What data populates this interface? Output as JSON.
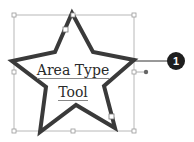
{
  "figure": {
    "text_lines": [
      "Area Type",
      "Tool"
    ],
    "callout": {
      "number": "1"
    },
    "colors": {
      "star_stroke": "#3a3a3a",
      "bounding_box": "#b5b5b5",
      "callout_fill": "#1e1e1e",
      "text": "#2a2a2a"
    }
  }
}
